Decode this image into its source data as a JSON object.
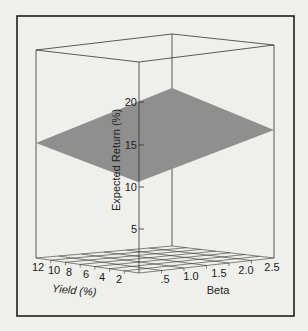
{
  "chart_data": {
    "type": "surface3d",
    "title": "",
    "xlabel": "Beta",
    "ylabel": "Yield (%)",
    "zlabel": "Expected Return (%)",
    "x_ticks": [
      ".5",
      "1.0",
      "1.5",
      "2.0",
      "2.5"
    ],
    "y_ticks": [
      "12",
      "10",
      "8",
      "6",
      "4",
      "2"
    ],
    "z_ticks": [
      "5",
      "10",
      "15",
      "20"
    ],
    "zlim": [
      0,
      25
    ],
    "grid": "floor",
    "plane_corners": [
      {
        "beta": 0.0,
        "yield": 0,
        "expected_return": 10.7
      },
      {
        "beta": 2.8,
        "yield": 0,
        "expected_return": 15.1
      },
      {
        "beta": 0.0,
        "yield": 13,
        "expected_return": 13.6
      },
      {
        "beta": 2.8,
        "yield": 13,
        "expected_return": 18.7
      }
    ],
    "surface_description": "Flat plane: expected return increases with both beta and yield",
    "colors": {
      "plane": "#8f8f8f",
      "frame": "#222222",
      "background": "#efefec"
    }
  },
  "labels": {
    "zlabel": "Expected Return (%)",
    "yield_label": "Yield (%)",
    "beta_label": "Beta",
    "z_ticks": [
      "20",
      "15",
      "10",
      "5"
    ],
    "yield_ticks": [
      "12",
      "10",
      "8",
      "6",
      "4",
      "2"
    ],
    "beta_ticks": [
      ".5",
      "1.0",
      "1.5",
      "2.0",
      "2.5"
    ]
  }
}
